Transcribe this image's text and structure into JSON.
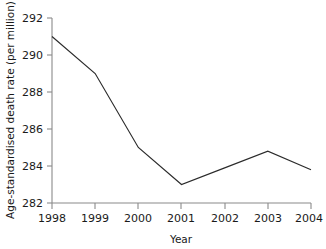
{
  "chart_data": {
    "type": "line",
    "title": "",
    "xlabel": "Year",
    "ylabel": "Age-standardised death rate (per million)",
    "categories": [
      "1998",
      "1999",
      "2000",
      "2001",
      "2002",
      "2003",
      "2004"
    ],
    "x": [
      1998,
      1999,
      2000,
      2001,
      2002,
      2003,
      2004
    ],
    "values": [
      291.0,
      289.0,
      285.0,
      283.0,
      283.9,
      284.8,
      283.8
    ],
    "series": [
      {
        "name": "Age-standardised death rate",
        "values": [
          291.0,
          289.0,
          285.0,
          283.0,
          283.9,
          284.8,
          283.8
        ]
      }
    ],
    "xlim": [
      1998,
      2004
    ],
    "ylim": [
      282,
      292
    ],
    "ytick_labels": [
      "282",
      "284",
      "286",
      "288",
      "290",
      "292"
    ],
    "ytick_values": [
      282,
      284,
      286,
      288,
      290,
      292
    ],
    "xtick_labels": [
      "1998",
      "1999",
      "2000",
      "2001",
      "2002",
      "2003",
      "2004"
    ],
    "grid": false,
    "legend": false,
    "legend_position": "none",
    "line_color": "#2b2b2b",
    "axis_color": "#8a8a8a",
    "background_color": "#ffffff"
  }
}
